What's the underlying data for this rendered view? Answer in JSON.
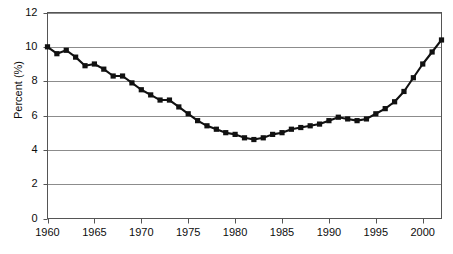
{
  "chart_data": {
    "type": "line",
    "title": "",
    "subtitle": "",
    "xlabel": "",
    "ylabel": "Percent (%)",
    "xlim": [
      1960,
      2002
    ],
    "ylim": [
      0,
      12
    ],
    "grid": "horizontal",
    "legend": "none",
    "marker": "square",
    "line_color": "#111111",
    "marker_color": "#111111",
    "grid_color": "#8c8c8c",
    "axis_color": "#555555",
    "background": "#ffffff",
    "y_ticks": [
      0,
      2,
      4,
      6,
      8,
      10,
      12
    ],
    "y_tick_labels": [
      "0",
      "2",
      "4",
      "6",
      "8",
      "10",
      "12"
    ],
    "x_ticks": [
      1960,
      1965,
      1970,
      1975,
      1980,
      1985,
      1990,
      1995,
      2000
    ],
    "x_tick_labels": [
      "1960",
      "1965",
      "1970",
      "1975",
      "1980",
      "1985",
      "1990",
      "1995",
      "2000"
    ],
    "x": [
      1960,
      1961,
      1962,
      1963,
      1964,
      1965,
      1966,
      1967,
      1968,
      1969,
      1970,
      1971,
      1972,
      1973,
      1974,
      1975,
      1976,
      1977,
      1978,
      1979,
      1980,
      1981,
      1982,
      1983,
      1984,
      1985,
      1986,
      1987,
      1988,
      1989,
      1990,
      1991,
      1992,
      1993,
      1994,
      1995,
      1996,
      1997,
      1998,
      1999,
      2000,
      2001,
      2002
    ],
    "values": [
      10.0,
      9.6,
      9.8,
      9.4,
      8.9,
      9.0,
      8.7,
      8.3,
      8.3,
      7.9,
      7.5,
      7.2,
      6.9,
      6.9,
      6.5,
      6.1,
      5.7,
      5.4,
      5.2,
      5.0,
      4.9,
      4.7,
      4.6,
      4.7,
      4.9,
      5.0,
      5.2,
      5.3,
      5.4,
      5.5,
      5.7,
      5.9,
      5.8,
      5.7,
      5.8,
      6.1,
      6.4,
      6.8,
      7.4,
      8.2,
      9.0,
      9.7,
      10.4
    ],
    "series_name": "Percent"
  }
}
